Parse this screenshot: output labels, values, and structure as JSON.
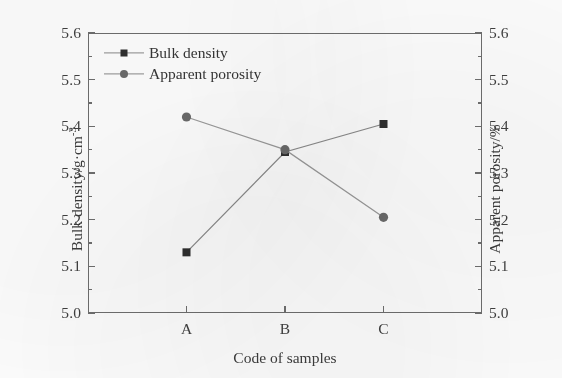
{
  "chart_data": {
    "type": "line",
    "title": "",
    "xlabel": "Code of samples",
    "ylabel": "Bulk density/g·cm",
    "ylabel_exponent": "-3",
    "y2label": "Apparent porosity/%",
    "categories": [
      "A",
      "B",
      "C"
    ],
    "ylim": [
      5.0,
      5.6
    ],
    "y2lim": [
      5.0,
      5.6
    ],
    "yticks": [
      "5.0",
      "5.1",
      "5.2",
      "5.3",
      "5.4",
      "5.5",
      "5.6"
    ],
    "ytick_values": [
      5.0,
      5.1,
      5.2,
      5.3,
      5.4,
      5.5,
      5.6
    ],
    "y2ticks": [
      "5.0",
      "5.1",
      "5.2",
      "5.3",
      "5.4",
      "5.5",
      "5.6"
    ],
    "y2tick_values": [
      5.0,
      5.1,
      5.2,
      5.3,
      5.4,
      5.5,
      5.6
    ],
    "minor_ticks": true,
    "grid": false,
    "legend_position": "upper left",
    "series": [
      {
        "name": "Bulk density",
        "axis": "left",
        "marker": "square",
        "color": "#2f2f2f",
        "line_color": "#8a8a8a",
        "values": [
          5.13,
          5.345,
          5.405
        ]
      },
      {
        "name": "Apparent porosity",
        "axis": "right",
        "marker": "circle",
        "color": "#6a6a6a",
        "line_color": "#9a9a9a",
        "values": [
          5.42,
          5.35,
          5.205
        ]
      }
    ]
  },
  "legend": {
    "items": [
      {
        "label": "Bulk density",
        "marker": "square"
      },
      {
        "label": "Apparent porosity",
        "marker": "circle"
      }
    ]
  },
  "axes": {
    "left_title_main": "Bulk density/g·cm",
    "left_title_sup": "-3",
    "right_title": "Apparent porosity/%",
    "x_title": "Code of samples"
  },
  "colors": {
    "frame": "#6e6e6e",
    "square_marker": "#2f2f2f",
    "circle_marker": "#6a6a6a",
    "line": "#8f8f8f",
    "text": "#3c3c3c",
    "background": "#fdfdfd"
  }
}
